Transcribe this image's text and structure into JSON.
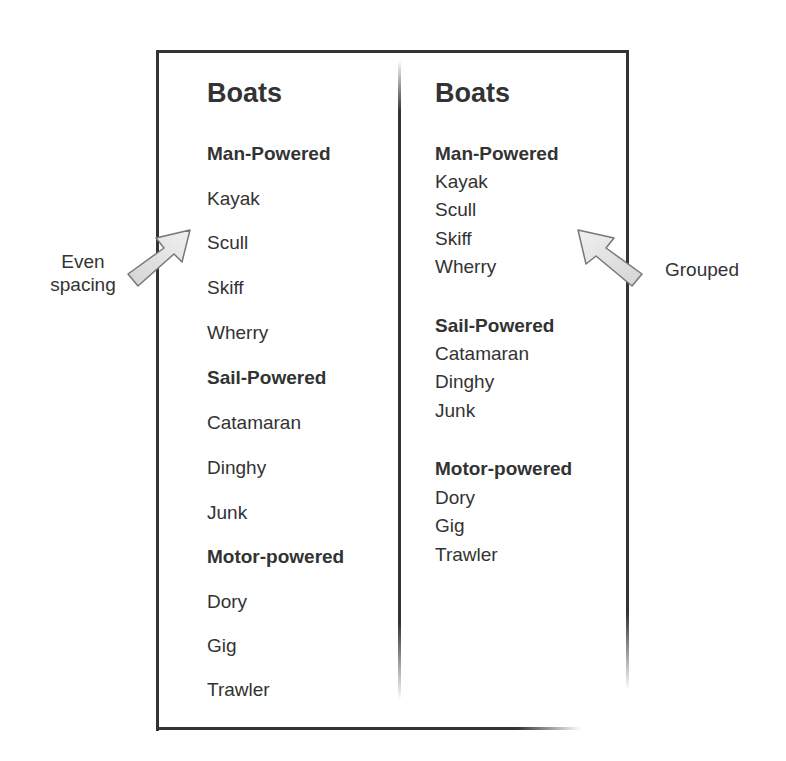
{
  "left_panel": {
    "title": "Boats",
    "annotation": "Even spacing",
    "annotation_lines": [
      "Even",
      "spacing"
    ],
    "layout": "even",
    "rows": [
      {
        "label": "Man-Powered",
        "type": "heading"
      },
      {
        "label": "Kayak",
        "type": "item"
      },
      {
        "label": "Scull",
        "type": "item"
      },
      {
        "label": "Skiff",
        "type": "item"
      },
      {
        "label": "Wherry",
        "type": "item"
      },
      {
        "label": "Sail-Powered",
        "type": "heading"
      },
      {
        "label": "Catamaran",
        "type": "item"
      },
      {
        "label": "Dinghy",
        "type": "item"
      },
      {
        "label": "Junk",
        "type": "item"
      },
      {
        "label": "Motor-powered",
        "type": "heading"
      },
      {
        "label": "Dory",
        "type": "item"
      },
      {
        "label": "Gig",
        "type": "item"
      },
      {
        "label": "Trawler",
        "type": "item"
      }
    ]
  },
  "right_panel": {
    "title": "Boats",
    "annotation": "Grouped",
    "layout": "grouped",
    "groups": [
      {
        "heading": "Man-Powered",
        "items": [
          "Kayak",
          "Scull",
          "Skiff",
          "Wherry"
        ]
      },
      {
        "heading": "Sail-Powered",
        "items": [
          "Catamaran",
          "Dinghy",
          "Junk"
        ]
      },
      {
        "heading": "Motor-powered",
        "items": [
          "Dory",
          "Gig",
          "Trawler"
        ]
      }
    ]
  },
  "colors": {
    "text": "#333333",
    "frame": "#333333",
    "arrow_fill": "#e2e2e2",
    "arrow_stroke": "#777777"
  }
}
